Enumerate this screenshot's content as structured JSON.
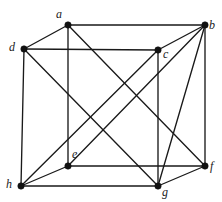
{
  "figure": {
    "width": 222,
    "height": 202,
    "background_color": "#ffffff",
    "edge_color": "#1a1a1a",
    "vertex_color": "#111111",
    "label_color": "#1a1a1a",
    "vertex_radius": 3.2,
    "edge_width": 1.35
  },
  "vertices": [
    {
      "id": "a",
      "label": "a",
      "x": 68,
      "y": 25,
      "label_x": 56,
      "label_y": 8
    },
    {
      "id": "b",
      "label": "b",
      "x": 205,
      "y": 25,
      "label_x": 209,
      "label_y": 19
    },
    {
      "id": "c",
      "label": "c",
      "x": 158,
      "y": 50,
      "label_x": 163,
      "label_y": 48
    },
    {
      "id": "d",
      "label": "d",
      "x": 24,
      "y": 49,
      "label_x": 9,
      "label_y": 41
    },
    {
      "id": "e",
      "label": "e",
      "x": 68,
      "y": 166,
      "label_x": 72,
      "label_y": 148
    },
    {
      "id": "f",
      "label": "f",
      "x": 205,
      "y": 166,
      "label_x": 210,
      "label_y": 160
    },
    {
      "id": "g",
      "label": "g",
      "x": 158,
      "y": 186,
      "label_x": 162,
      "label_y": 186
    },
    {
      "id": "h",
      "label": "h",
      "x": 21,
      "y": 186,
      "label_x": 6,
      "label_y": 178
    }
  ],
  "edges": [
    {
      "from": "a",
      "to": "b",
      "name": "edge-a-b"
    },
    {
      "from": "a",
      "to": "d",
      "name": "edge-a-d"
    },
    {
      "from": "a",
      "to": "e",
      "name": "edge-a-e"
    },
    {
      "from": "a",
      "to": "f",
      "name": "edge-a-f"
    },
    {
      "from": "b",
      "to": "c",
      "name": "edge-b-c"
    },
    {
      "from": "b",
      "to": "e",
      "name": "edge-b-e"
    },
    {
      "from": "b",
      "to": "f",
      "name": "edge-b-f"
    },
    {
      "from": "b",
      "to": "g",
      "name": "edge-b-g"
    },
    {
      "from": "c",
      "to": "d",
      "name": "edge-c-d"
    },
    {
      "from": "c",
      "to": "g",
      "name": "edge-c-g"
    },
    {
      "from": "c",
      "to": "h",
      "name": "edge-c-h"
    },
    {
      "from": "d",
      "to": "g",
      "name": "edge-d-g"
    },
    {
      "from": "d",
      "to": "h",
      "name": "edge-d-h"
    },
    {
      "from": "e",
      "to": "f",
      "name": "edge-e-f"
    },
    {
      "from": "e",
      "to": "h",
      "name": "edge-e-h"
    },
    {
      "from": "f",
      "to": "g",
      "name": "edge-f-g"
    },
    {
      "from": "g",
      "to": "h",
      "name": "edge-g-h"
    }
  ]
}
